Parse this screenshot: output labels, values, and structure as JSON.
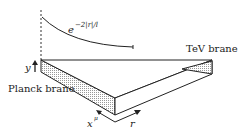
{
  "labels": {
    "warp": "e",
    "warp_exp": "−2|r|/l",
    "tev": "TeV brane",
    "planck": "Planck brane",
    "y": "y",
    "x": "x",
    "x_sup": "μ",
    "r": "r"
  }
}
